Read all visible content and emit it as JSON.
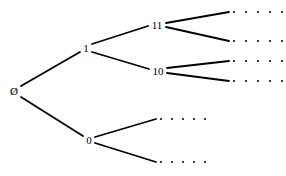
{
  "figure": {
    "kind": "binary-tree-diagram",
    "background_color": "#ffffff",
    "stroke_color": "#000000",
    "text_color": "#000000",
    "width": 286,
    "height": 176
  },
  "nodes": [
    {
      "id": "root",
      "label": "Ø",
      "x": 14,
      "y": 91
    },
    {
      "id": "n1",
      "label": "1",
      "x": 86,
      "y": 48
    },
    {
      "id": "n0",
      "label": "0",
      "x": 89,
      "y": 140
    },
    {
      "id": "n11",
      "label": "11",
      "x": 157,
      "y": 25
    },
    {
      "id": "n10",
      "label": "10",
      "x": 158,
      "y": 71
    }
  ],
  "edges": [
    {
      "from": "root",
      "to": "n1",
      "x1": 21,
      "y1": 86,
      "x2": 80,
      "y2": 52
    },
    {
      "from": "root",
      "to": "n0",
      "x1": 21,
      "y1": 97,
      "x2": 83,
      "y2": 136
    },
    {
      "from": "n1",
      "to": "n11",
      "x1": 92,
      "y1": 44,
      "x2": 148,
      "y2": 26
    },
    {
      "from": "n1",
      "to": "n10",
      "x1": 92,
      "y1": 52,
      "x2": 149,
      "y2": 69
    },
    {
      "from": "n11",
      "to": "leaf1",
      "x1": 166,
      "y1": 23,
      "x2": 229,
      "y2": 12
    },
    {
      "from": "n11",
      "to": "leaf2",
      "x1": 166,
      "y1": 27,
      "x2": 229,
      "y2": 41
    },
    {
      "from": "n10",
      "to": "leaf3",
      "x1": 167,
      "y1": 68,
      "x2": 229,
      "y2": 61
    },
    {
      "from": "n10",
      "to": "leaf4",
      "x1": 167,
      "y1": 73,
      "x2": 229,
      "y2": 81
    },
    {
      "from": "n0",
      "to": "leaf5",
      "x1": 95,
      "y1": 137,
      "x2": 156,
      "y2": 119
    },
    {
      "from": "n0",
      "to": "leaf6",
      "x1": 95,
      "y1": 143,
      "x2": 156,
      "y2": 162
    }
  ],
  "ellipsis_rows": [
    {
      "id": "leaf1",
      "x": 233,
      "y": 12,
      "dots": 5,
      "spacing": 12
    },
    {
      "id": "leaf2",
      "x": 233,
      "y": 41,
      "dots": 5,
      "spacing": 12
    },
    {
      "id": "leaf3",
      "x": 233,
      "y": 61,
      "dots": 5,
      "spacing": 12
    },
    {
      "id": "leaf4",
      "x": 233,
      "y": 81,
      "dots": 5,
      "spacing": 12
    },
    {
      "id": "leaf5",
      "x": 160,
      "y": 119,
      "dots": 5,
      "spacing": 11
    },
    {
      "id": "leaf6",
      "x": 160,
      "y": 162,
      "dots": 5,
      "spacing": 11
    }
  ]
}
